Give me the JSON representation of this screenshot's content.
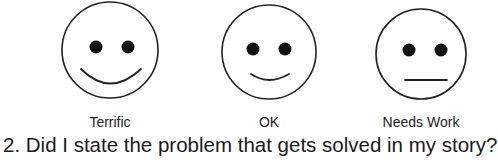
{
  "rating_scale": {
    "options": [
      {
        "label": "Terrific",
        "icon": "big-smile-face-icon",
        "expression": "big-smile"
      },
      {
        "label": "OK",
        "icon": "small-smile-face-icon",
        "expression": "small-smile"
      },
      {
        "label": "Needs Work",
        "icon": "neutral-face-icon",
        "expression": "neutral"
      }
    ]
  },
  "question": {
    "text": "2. Did I state the problem that gets solved in my story?"
  },
  "colors": {
    "ink": "#1a1a1a",
    "background": "#ffffff"
  }
}
